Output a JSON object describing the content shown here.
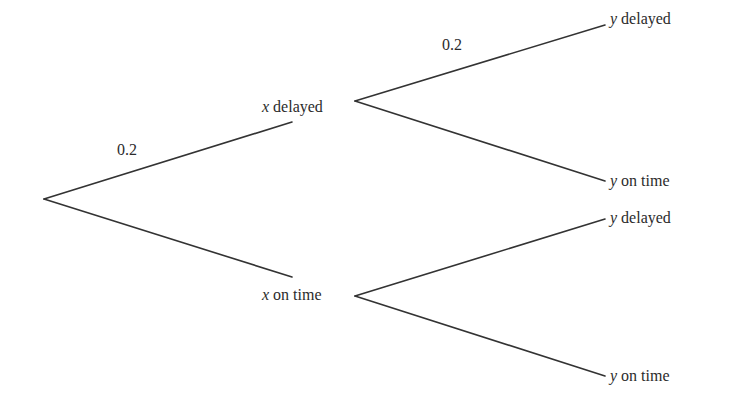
{
  "diagram": {
    "type": "probability-tree",
    "root": {
      "x": 44,
      "y": 199
    },
    "stage1": {
      "nodes": [
        {
          "id": "x-delayed",
          "variable": "x",
          "text": "delayed",
          "branch_end": {
            "x": 292,
            "y": 122
          },
          "label_pos": {
            "left": 262,
            "top": 98
          },
          "probability": "0.2",
          "prob_pos": {
            "left": 117,
            "top": 141
          }
        },
        {
          "id": "x-on-time",
          "variable": "x",
          "text": "on time",
          "branch_end": {
            "x": 292,
            "y": 277
          },
          "label_pos": {
            "left": 262,
            "top": 286
          },
          "probability": "",
          "prob_pos": null
        }
      ]
    },
    "stage2": {
      "groups": [
        {
          "parent": "x-delayed",
          "junction": {
            "x": 355,
            "y": 101
          },
          "children": [
            {
              "id": "xd-y-delayed",
              "variable": "y",
              "text": "delayed",
              "branch_end": {
                "x": 605,
                "y": 25
              },
              "label_pos": {
                "left": 610,
                "top": 10
              },
              "probability": "0.2",
              "prob_pos": {
                "left": 442,
                "top": 36
              }
            },
            {
              "id": "xd-y-on-time",
              "variable": "y",
              "text": "on time",
              "branch_end": {
                "x": 605,
                "y": 181
              },
              "label_pos": {
                "left": 610,
                "top": 172
              },
              "probability": "",
              "prob_pos": null
            }
          ]
        },
        {
          "parent": "x-on-time",
          "junction": {
            "x": 355,
            "y": 296
          },
          "children": [
            {
              "id": "xo-y-delayed",
              "variable": "y",
              "text": "delayed",
              "branch_end": {
                "x": 605,
                "y": 219
              },
              "label_pos": {
                "left": 610,
                "top": 209
              },
              "probability": "",
              "prob_pos": null
            },
            {
              "id": "xo-y-on-time",
              "variable": "y",
              "text": "on time",
              "branch_end": {
                "x": 605,
                "y": 376
              },
              "label_pos": {
                "left": 610,
                "top": 367
              },
              "probability": "",
              "prob_pos": null
            }
          ]
        }
      ]
    },
    "colors": {
      "line": "#333333",
      "text": "#2b2b2b",
      "background": "#ffffff"
    }
  },
  "labels": {
    "x_delayed_var": "x",
    "x_delayed_text": " delayed",
    "x_on_time_var": "x",
    "x_on_time_text": " on time",
    "y1_delayed_var": "y",
    "y1_delayed_text": " delayed",
    "y1_on_time_var": "y",
    "y1_on_time_text": " on time",
    "y2_delayed_var": "y",
    "y2_delayed_text": " delayed",
    "y2_on_time_var": "y",
    "y2_on_time_text": " on time",
    "prob_x_delayed": "0.2",
    "prob_y_delayed_given_x_delayed": "0.2"
  }
}
